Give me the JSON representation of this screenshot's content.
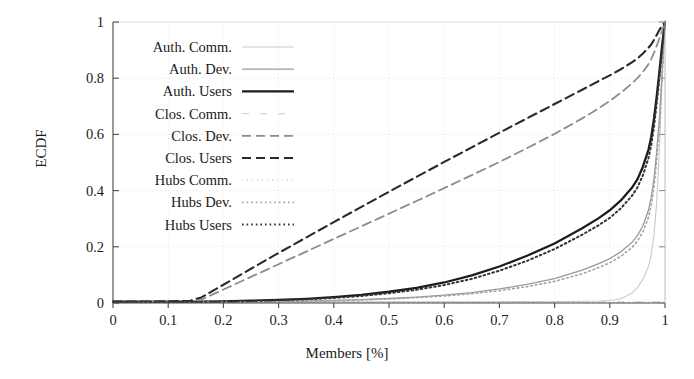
{
  "chart_data": {
    "type": "line",
    "title": "",
    "xlabel": "Members [%]",
    "ylabel": "ECDF",
    "xlim": [
      0,
      1
    ],
    "ylim": [
      0,
      1
    ],
    "xticks": [
      "0",
      "0.1",
      "0.2",
      "0.3",
      "0.4",
      "0.5",
      "0.6",
      "0.7",
      "0.8",
      "0.9",
      "1"
    ],
    "xtick_values": [
      0,
      0.1,
      0.2,
      0.3,
      0.4,
      0.5,
      0.6,
      0.7,
      0.8,
      0.9,
      1
    ],
    "yticks": [
      "0",
      "0.2",
      "0.4",
      "0.6",
      "0.8",
      "1"
    ],
    "ytick_values": [
      0,
      0.2,
      0.4,
      0.6,
      0.8,
      1
    ],
    "grid": true,
    "grid_style": "dotted-faint",
    "legend_position": "upper-left-inside",
    "x": [
      0,
      0.05,
      0.1,
      0.14,
      0.16,
      0.2,
      0.25,
      0.3,
      0.35,
      0.4,
      0.45,
      0.5,
      0.55,
      0.6,
      0.65,
      0.7,
      0.75,
      0.8,
      0.85,
      0.88,
      0.9,
      0.92,
      0.94,
      0.95,
      0.96,
      0.97,
      0.975,
      0.98,
      0.985,
      0.99,
      0.995,
      1
    ],
    "series": [
      {
        "name": "Auth. Comm.",
        "color": "#c9c9c9",
        "dash": "solid",
        "width": 1.1,
        "values": [
          0.004,
          0.004,
          0.004,
          0.004,
          0.004,
          0.004,
          0.004,
          0.004,
          0.004,
          0.004,
          0.004,
          0.004,
          0.004,
          0.004,
          0.004,
          0.005,
          0.005,
          0.005,
          0.006,
          0.007,
          0.009,
          0.015,
          0.035,
          0.055,
          0.085,
          0.13,
          0.17,
          0.24,
          0.36,
          0.55,
          0.82,
          1.0
        ]
      },
      {
        "name": "Auth. Dev.",
        "color": "#9a9a9a",
        "dash": "solid",
        "width": 1.3,
        "values": [
          0.003,
          0.003,
          0.003,
          0.003,
          0.003,
          0.003,
          0.004,
          0.005,
          0.007,
          0.009,
          0.012,
          0.016,
          0.021,
          0.028,
          0.037,
          0.05,
          0.066,
          0.087,
          0.117,
          0.14,
          0.158,
          0.182,
          0.215,
          0.24,
          0.275,
          0.33,
          0.375,
          0.44,
          0.54,
          0.66,
          0.83,
          1.0
        ]
      },
      {
        "name": "Auth. Users",
        "color": "#1c1c1c",
        "dash": "solid",
        "width": 2.3,
        "values": [
          0.005,
          0.005,
          0.005,
          0.005,
          0.005,
          0.006,
          0.008,
          0.011,
          0.015,
          0.021,
          0.029,
          0.04,
          0.054,
          0.073,
          0.098,
          0.13,
          0.168,
          0.212,
          0.266,
          0.302,
          0.33,
          0.365,
          0.41,
          0.44,
          0.485,
          0.545,
          0.59,
          0.655,
          0.735,
          0.825,
          0.92,
          1.0
        ]
      },
      {
        "name": "Clos. Comm.",
        "color": "#d6d6d6",
        "dash": "dashed-sparse",
        "width": 1.1,
        "values": [
          0.004,
          0.004,
          0.004,
          0.004,
          0.004,
          0.004,
          0.004,
          0.004,
          0.004,
          0.004,
          0.004,
          0.004,
          0.004,
          0.004,
          0.004,
          0.004,
          0.004,
          0.004,
          0.004,
          0.004,
          0.004,
          0.004,
          0.004,
          0.004,
          0.004,
          0.004,
          0.004,
          0.004,
          0.004,
          0.004,
          0.004,
          0.004
        ]
      },
      {
        "name": "Clos. Dev.",
        "color": "#8d8d8d",
        "dash": "dashed",
        "width": 1.8,
        "values": [
          0.004,
          0.004,
          0.004,
          0.006,
          0.012,
          0.048,
          0.093,
          0.138,
          0.183,
          0.228,
          0.273,
          0.318,
          0.363,
          0.409,
          0.455,
          0.502,
          0.551,
          0.602,
          0.657,
          0.693,
          0.719,
          0.748,
          0.781,
          0.8,
          0.822,
          0.85,
          0.868,
          0.89,
          0.915,
          0.942,
          0.97,
          1.0
        ]
      },
      {
        "name": "Clos. Users",
        "color": "#2a2a2a",
        "dash": "dashed",
        "width": 2.1,
        "values": [
          0.005,
          0.005,
          0.006,
          0.008,
          0.02,
          0.065,
          0.122,
          0.178,
          0.233,
          0.288,
          0.342,
          0.396,
          0.449,
          0.502,
          0.554,
          0.606,
          0.657,
          0.708,
          0.759,
          0.79,
          0.81,
          0.832,
          0.856,
          0.87,
          0.888,
          0.908,
          0.92,
          0.936,
          0.954,
          0.972,
          0.988,
          1.0
        ]
      },
      {
        "name": "Hubs Comm.",
        "color": "#b5b5b5",
        "dash": "dotted-fine",
        "width": 1.0,
        "values": [
          0.003,
          0.003,
          0.003,
          0.003,
          0.003,
          0.003,
          0.003,
          0.003,
          0.003,
          0.003,
          0.003,
          0.003,
          0.003,
          0.003,
          0.003,
          0.003,
          0.003,
          0.003,
          0.003,
          0.003,
          0.003,
          0.003,
          0.003,
          0.003,
          0.003,
          0.003,
          0.003,
          0.003,
          0.003,
          0.003,
          0.003,
          0.003
        ]
      },
      {
        "name": "Hubs Dev.",
        "color": "#a3a3a3",
        "dash": "dotted",
        "width": 1.6,
        "values": [
          0.003,
          0.003,
          0.003,
          0.003,
          0.003,
          0.003,
          0.004,
          0.005,
          0.006,
          0.008,
          0.011,
          0.014,
          0.019,
          0.025,
          0.033,
          0.044,
          0.058,
          0.077,
          0.104,
          0.126,
          0.143,
          0.166,
          0.197,
          0.22,
          0.253,
          0.305,
          0.348,
          0.412,
          0.51,
          0.635,
          0.81,
          1.0
        ]
      },
      {
        "name": "Hubs Users",
        "color": "#333333",
        "dash": "dotted",
        "width": 2.0,
        "values": [
          0.004,
          0.004,
          0.004,
          0.004,
          0.004,
          0.005,
          0.007,
          0.01,
          0.013,
          0.018,
          0.025,
          0.035,
          0.047,
          0.064,
          0.086,
          0.115,
          0.15,
          0.192,
          0.243,
          0.277,
          0.303,
          0.337,
          0.381,
          0.411,
          0.455,
          0.515,
          0.561,
          0.627,
          0.71,
          0.805,
          0.908,
          1.0
        ]
      }
    ]
  },
  "axes": {
    "x_label": "Members [%]",
    "y_label": "ECDF"
  }
}
